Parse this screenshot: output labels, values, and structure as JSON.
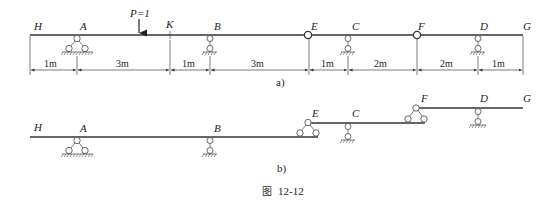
{
  "figure": {
    "caption_prefix": "图",
    "caption_number": "12-12"
  },
  "diagram_a": {
    "label": "a)",
    "load": "P=1",
    "points": {
      "H": "H",
      "A": "A",
      "K": "K",
      "B": "B",
      "E": "E",
      "C": "C",
      "F": "F",
      "D": "D",
      "G": "G"
    },
    "dimensions": [
      "1m",
      "3m",
      "1m",
      "3m",
      "1m",
      "2m",
      "2m",
      "1m"
    ]
  },
  "diagram_b": {
    "label": "b)",
    "points": {
      "H": "H",
      "A": "A",
      "B": "B",
      "E": "E",
      "C": "C",
      "F": "F",
      "D": "D",
      "G": "G"
    }
  },
  "colors": {
    "line": "#333333",
    "background": "#ffffff"
  }
}
